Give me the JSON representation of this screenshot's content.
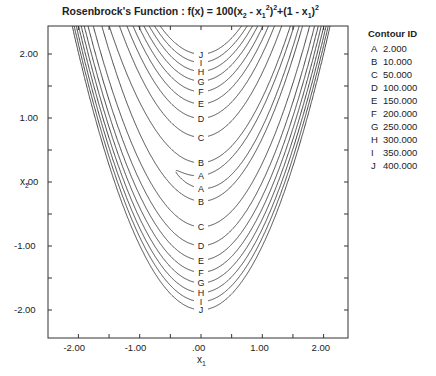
{
  "chart_data": {
    "type": "contour",
    "title_parts": {
      "prefix": "Rosenbrock's Function :  f(x) = 100(x",
      "s1": "2",
      "mid1": " - x",
      "s2": "1",
      "p1": "2",
      "p2": "2",
      "mid2": "+(1 - x",
      "s3": "1",
      "suffix": ")",
      "p3": "2"
    },
    "xlabel": "x1",
    "ylabel": "x2",
    "xlim": [
      -2.5,
      2.4
    ],
    "ylim": [
      -2.5,
      2.45
    ],
    "x_ticks": [
      -2.0,
      -1.5,
      -1.0,
      -0.5,
      0.0,
      0.5,
      1.0,
      1.5,
      2.0
    ],
    "x_tick_labels": [
      "-2.00",
      "-1.00",
      ".00",
      "1.00",
      "2.00"
    ],
    "x_tick_label_values": [
      -2.0,
      -1.0,
      0.0,
      1.0,
      2.0
    ],
    "y_ticks": [
      -2.0,
      -1.5,
      -1.0,
      -0.5,
      0.0,
      0.5,
      1.0,
      1.5,
      2.0
    ],
    "y_tick_labels": [
      "2.00",
      "1.00",
      ".00",
      "-1.00",
      "-2.00"
    ],
    "y_tick_label_values": [
      2.0,
      1.0,
      0.0,
      -1.0,
      -2.0
    ],
    "grid": false,
    "legend_position": "right",
    "legend_title": "Contour ID",
    "contours": [
      {
        "id": "A",
        "level": 2.0,
        "label": "2.000"
      },
      {
        "id": "B",
        "level": 10.0,
        "label": "10.000"
      },
      {
        "id": "C",
        "level": 50.0,
        "label": "50.000"
      },
      {
        "id": "D",
        "level": 100.0,
        "label": "100.000"
      },
      {
        "id": "E",
        "level": 150.0,
        "label": "150.000"
      },
      {
        "id": "F",
        "level": 200.0,
        "label": "200.000"
      },
      {
        "id": "G",
        "level": 250.0,
        "label": "250.000"
      },
      {
        "id": "H",
        "level": 300.0,
        "label": "300.000"
      },
      {
        "id": "I",
        "level": 350.0,
        "label": "350.000"
      },
      {
        "id": "J",
        "level": 400.0,
        "label": "400.000"
      }
    ],
    "inline_labels_top_to_bottom": [
      "J",
      "I",
      "H",
      "G",
      "F",
      "E",
      "D",
      "C",
      "B",
      "A",
      "A",
      "B",
      "C",
      "D",
      "E",
      "F",
      "G",
      "H",
      "I",
      "J"
    ]
  },
  "colors": {
    "line": "#333333",
    "background": "#ffffff",
    "text": "#222222"
  }
}
